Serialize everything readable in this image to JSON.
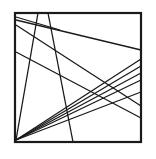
{
  "figure": {
    "canvas": {
      "width": 156,
      "height": 159,
      "background": "#ffffff"
    },
    "ink_color": "#1a1a1a",
    "frame": {
      "name": "square-border",
      "x": 15,
      "y": 13,
      "width": 126,
      "height": 129,
      "stroke": "#1a1a1a",
      "stroke_width": 2.2
    },
    "lines": [
      {
        "name": "fan-line-1",
        "x1": 16,
        "y1": 140,
        "x2": 141,
        "y2": 59,
        "stroke_width": 1.3
      },
      {
        "name": "fan-line-2",
        "x1": 16,
        "y1": 140,
        "x2": 141,
        "y2": 66,
        "stroke_width": 1.3
      },
      {
        "name": "fan-line-3",
        "x1": 16,
        "y1": 140,
        "x2": 141,
        "y2": 73,
        "stroke_width": 1.3
      },
      {
        "name": "fan-line-4",
        "x1": 16,
        "y1": 140,
        "x2": 141,
        "y2": 80,
        "stroke_width": 1.3
      },
      {
        "name": "fan-line-5",
        "x1": 16,
        "y1": 140,
        "x2": 141,
        "y2": 92,
        "stroke_width": 1.3
      },
      {
        "name": "diagonal-top-left-to-right",
        "x1": 16,
        "y1": 20,
        "x2": 141,
        "y2": 50,
        "stroke_width": 1.3
      },
      {
        "name": "diagonal-upper-left-to-right",
        "x1": 16,
        "y1": 25,
        "x2": 141,
        "y2": 106,
        "stroke_width": 1.3
      },
      {
        "name": "diagonal-mid-left-to-right",
        "x1": 16,
        "y1": 52,
        "x2": 141,
        "y2": 118,
        "stroke_width": 1.3
      },
      {
        "name": "steep-line-left",
        "x1": 38,
        "y1": 13,
        "x2": 16,
        "y2": 140,
        "stroke_width": 1.3
      },
      {
        "name": "steep-line-right",
        "x1": 48,
        "y1": 13,
        "x2": 73,
        "y2": 142,
        "stroke_width": 1.3
      },
      {
        "name": "short-top-chord",
        "x1": 16,
        "y1": 17,
        "x2": 60,
        "y2": 30,
        "stroke_width": 1.3
      }
    ]
  }
}
